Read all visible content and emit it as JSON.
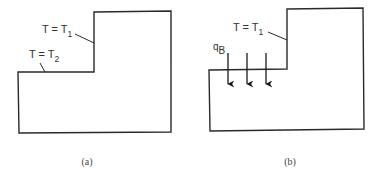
{
  "figure": {
    "panels": [
      {
        "id": "a",
        "caption": "(a)",
        "labels": [
          {
            "main": "T = T",
            "subscript": "1"
          },
          {
            "main": "T = T",
            "subscript": "2"
          }
        ]
      },
      {
        "id": "b",
        "caption": "(b)",
        "labels": [
          {
            "main": "T = T",
            "subscript": "1"
          }
        ],
        "flux_label": {
          "main": "q",
          "subscript": "B"
        },
        "flux_arrow_count": 3
      }
    ],
    "colors": {
      "stroke": "#2a2a2a",
      "text": "#333333",
      "background": "#ffffff"
    }
  }
}
